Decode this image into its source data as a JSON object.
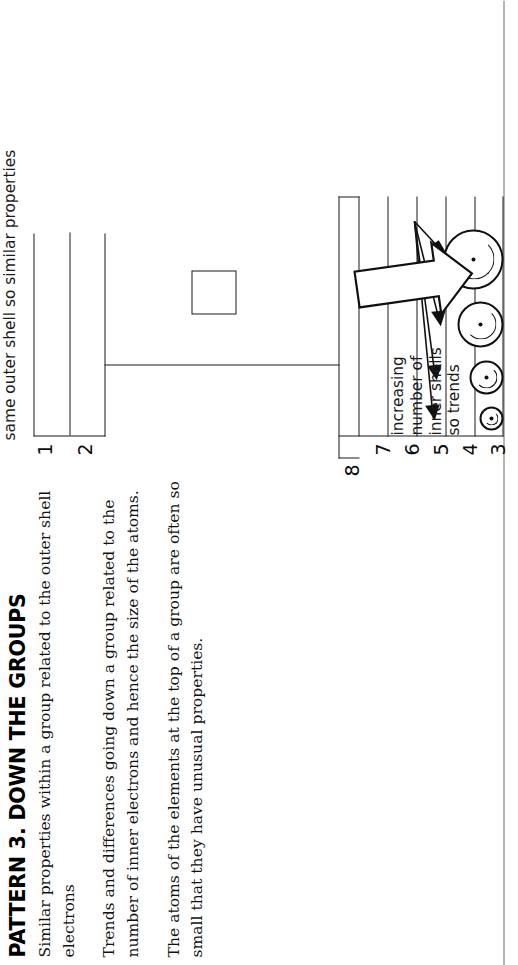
{
  "page": {
    "title": "PATTERN 3. DOWN THE GROUPS",
    "paragraphs": [
      "Similar properties within a group related to the outer shell electrons",
      "Trends and differences going down a group related to the number of inner electrons and hence the size of the atoms.",
      "The atoms of the elements at the top of a group are often so small that they have unusual properties."
    ]
  },
  "diagram": {
    "name": "periodic-table-group-trend-schematic",
    "row_labels_main": [
      "3",
      "4",
      "5",
      "6",
      "7",
      "8"
    ],
    "row_labels_top": [
      "1",
      "2"
    ],
    "annotations": {
      "trend_caption_lines": [
        "increasing",
        "number of",
        "inner shells",
        "so trends"
      ],
      "trend_caption": "increasing number of inner shells so trends",
      "group_caption": "same outer shell so similar properties"
    },
    "atoms": {
      "count": 4,
      "description": "four atoms of increasing radius, each with a nucleus dot and an inner shell arc",
      "diameters": [
        24,
        34,
        46,
        60
      ]
    },
    "arrows": {
      "block_arrow_direction": "down",
      "thin_arrow_count": 4
    },
    "colors": {
      "ink": "#1b1b1b",
      "rule": "#6a6a6a",
      "background": "#ffffff"
    }
  }
}
